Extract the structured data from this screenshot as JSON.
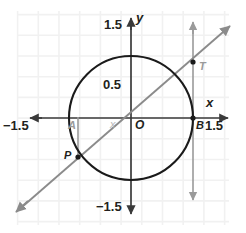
{
  "figure": {
    "type": "coordinate-plane-diagram",
    "background": "#ffffff",
    "grid": {
      "visible": true,
      "color": "#f1f1f1",
      "spacing_px": 20.7,
      "spacing_units": 0.25
    },
    "colors": {
      "axis": "#3a3a3a",
      "circle": "#1a1a1a",
      "secant_line": "#8b8b8b",
      "tangent_line": "#9a9a9a",
      "segment": "#9a9a9a",
      "label_dark": "#231f20",
      "label_gray": "#9a9a9a",
      "label_light": "#b9b9b9"
    },
    "axes": {
      "x_label": "x",
      "y_label": "y",
      "x_ticks": [
        "−1.5",
        "1.5"
      ],
      "y_ticks": [
        "1.5",
        "0.5",
        "−1.5"
      ],
      "origin_label": "O",
      "range": [
        -1.5,
        1.5
      ]
    },
    "circle": {
      "center": [
        0,
        0
      ],
      "radius": 1.0
    },
    "points": [
      {
        "name": "A",
        "label": "A",
        "x": -0.866,
        "y": 0.0,
        "style": "gray"
      },
      {
        "name": "B",
        "label": "B",
        "x": 1.0,
        "y": 0.0,
        "style": "dark"
      },
      {
        "name": "O",
        "label": "O",
        "x": 0.0,
        "y": 0.0,
        "style": "dark"
      },
      {
        "name": "P",
        "label": "P",
        "x": -0.866,
        "y": -0.6,
        "style": "dark"
      },
      {
        "name": "T",
        "label": "T",
        "x": 1.0,
        "y": 0.9,
        "style": "gray"
      }
    ],
    "segments": [
      {
        "name": "AP",
        "from": "A",
        "to": "P",
        "color": "#9a9a9a"
      }
    ],
    "lines": [
      {
        "name": "secant-OPT",
        "description": "line through O, P and T",
        "slope": 0.9,
        "arrows": "both",
        "color": "#8b8b8b"
      },
      {
        "name": "tangent-at-B",
        "description": "vertical tangent line at x = 1",
        "arrows": "both",
        "color": "#9a9a9a"
      }
    ],
    "var_label": "x"
  }
}
